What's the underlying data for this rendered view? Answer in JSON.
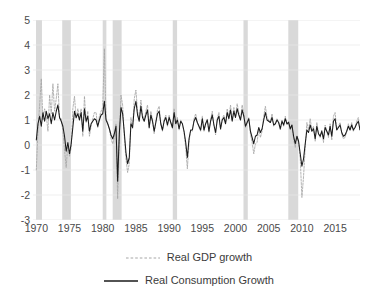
{
  "chart_data": {
    "type": "line",
    "title": "",
    "subtitle": "",
    "xlabel": "",
    "ylabel": "",
    "xlim": [
      1969.5,
      2018.75
    ],
    "ylim": [
      -3,
      5
    ],
    "ytick_values": [
      5,
      4,
      3,
      2,
      1,
      0,
      -1,
      -2,
      -3
    ],
    "ytick_labels": [
      "5",
      "4",
      "3",
      "2",
      "1",
      "0",
      "-1",
      "-2",
      "-3"
    ],
    "xtick_values": [
      1970,
      1975,
      1980,
      1985,
      1990,
      1995,
      2000,
      2005,
      2010,
      2015
    ],
    "xtick_labels": [
      "1970",
      "1975",
      "1980",
      "1985",
      "1990",
      "1995",
      "2000",
      "2005",
      "2010",
      "2015"
    ],
    "grid": "horizontal",
    "legend_position": "bottom-center",
    "colors": {
      "gdp": "#a6a6a6",
      "consumption": "#1a1a1a",
      "recession_band": "#d9d9d9",
      "gridline": "#e8e8e8",
      "axis_text": "#4a4a4a"
    },
    "x_start": 1970,
    "x_step": 0.25,
    "recession_bands": [
      {
        "start": 1969.95,
        "end": 1970.85
      },
      {
        "start": 1973.9,
        "end": 1975.2
      },
      {
        "start": 1980.0,
        "end": 1980.55
      },
      {
        "start": 1981.5,
        "end": 1982.85
      },
      {
        "start": 1990.55,
        "end": 1991.2
      },
      {
        "start": 2001.2,
        "end": 2001.85
      },
      {
        "start": 2007.95,
        "end": 2009.45
      }
    ],
    "series": [
      {
        "name": "Real GDP growth",
        "key": "gdp",
        "style": "dashed",
        "color": "#a6a6a6",
        "values": [
          -1.0,
          0.6,
          1.6,
          2.65,
          1.0,
          1.45,
          1.2,
          0.55,
          2.0,
          1.25,
          2.45,
          1.35,
          1.85,
          2.45,
          1.05,
          1.05,
          0.55,
          -0.2,
          -0.9,
          0.05,
          -0.45,
          -0.1,
          1.45,
          1.95,
          1.05,
          1.45,
          1.1,
          1.45,
          0.35,
          1.95,
          0.9,
          1.35,
          0.35,
          0.75,
          1.05,
          1.3,
          1.3,
          0.7,
          1.15,
          1.35,
          1.5,
          3.85,
          1.05,
          0.9,
          0.65,
          0.25,
          0.05,
          0.3,
          0.85,
          -2.15,
          0.35,
          2.0,
          1.6,
          0.35,
          -0.55,
          -1.1,
          -0.75,
          1.1,
          0.65,
          1.85,
          2.2,
          1.35,
          1.0,
          1.8,
          1.2,
          1.0,
          1.35,
          1.6,
          0.65,
          1.35,
          1.0,
          0.45,
          0.95,
          1.4,
          1.55,
          0.85,
          0.55,
          1.0,
          1.2,
          0.75,
          1.2,
          0.9,
          0.65,
          1.45,
          0.85,
          1.1,
          0.6,
          1.0,
          0.85,
          0.5,
          -0.1,
          -0.95,
          0.1,
          0.6,
          0.55,
          1.05,
          1.25,
          0.9,
          0.7,
          0.55,
          1.15,
          0.55,
          0.85,
          1.05,
          0.5,
          1.0,
          1.35,
          0.8,
          0.4,
          1.05,
          1.3,
          0.6,
          1.05,
          1.2,
          0.85,
          1.45,
          1.1,
          1.6,
          1.0,
          1.5,
          1.15,
          1.65,
          1.3,
          1.0,
          1.6,
          1.25,
          0.7,
          0.9,
          1.1,
          0.45,
          0.1,
          -0.35,
          0.05,
          0.1,
          0.65,
          0.3,
          0.55,
          1.15,
          1.55,
          1.1,
          1.0,
          0.9,
          1.25,
          0.75,
          0.85,
          1.05,
          0.9,
          0.6,
          1.0,
          0.75,
          1.15,
          0.8,
          0.95,
          0.6,
          0.8,
          0.25,
          -0.1,
          0.35,
          0.1,
          -0.55,
          -2.1,
          -1.25,
          -0.1,
          0.9,
          0.6,
          1.05,
          0.6,
          0.75,
          0.15,
          0.9,
          0.45,
          0.3,
          0.6,
          0.1,
          0.8,
          0.55,
          0.3,
          0.85,
          0.2,
          1.15,
          1.3,
          0.6,
          0.75,
          0.9,
          0.45,
          0.25,
          0.3,
          0.55,
          0.85,
          0.6,
          0.9,
          0.55,
          0.7,
          0.95,
          1.1,
          0.6,
          0.85,
          0.75
        ]
      },
      {
        "name": "Real Consumption Growth",
        "key": "consumption",
        "style": "solid",
        "color": "#1a1a1a",
        "values": [
          0.2,
          0.85,
          1.15,
          0.75,
          1.3,
          0.95,
          1.35,
          1.05,
          1.25,
          0.85,
          1.3,
          1.0,
          1.35,
          1.6,
          1.1,
          0.95,
          0.75,
          0.35,
          -0.25,
          0.1,
          -0.35,
          0.05,
          0.7,
          1.35,
          1.1,
          1.25,
          1.0,
          1.3,
          0.55,
          1.45,
          0.95,
          1.15,
          0.55,
          0.85,
          0.95,
          1.05,
          1.0,
          0.75,
          1.0,
          1.2,
          1.25,
          1.75,
          1.0,
          0.85,
          0.65,
          0.4,
          0.25,
          0.45,
          0.75,
          -1.45,
          0.45,
          1.5,
          1.25,
          0.5,
          -0.3,
          -0.75,
          -0.5,
          0.85,
          0.7,
          1.45,
          1.75,
          1.2,
          0.95,
          1.55,
          1.1,
          0.95,
          1.2,
          1.4,
          0.7,
          1.2,
          0.95,
          0.55,
          0.9,
          1.25,
          1.35,
          0.85,
          0.6,
          0.95,
          1.1,
          0.8,
          1.1,
          0.9,
          0.7,
          1.3,
          0.85,
          1.0,
          0.65,
          0.95,
          0.85,
          0.55,
          0.1,
          -0.5,
          0.25,
          0.6,
          0.6,
          0.95,
          1.1,
          0.9,
          0.75,
          0.6,
          1.05,
          0.6,
          0.85,
          1.0,
          0.55,
          0.95,
          1.2,
          0.8,
          0.5,
          1.0,
          1.15,
          0.65,
          1.0,
          1.1,
          0.85,
          1.3,
          1.05,
          1.4,
          0.95,
          1.35,
          1.1,
          1.45,
          1.2,
          1.0,
          1.4,
          1.15,
          0.75,
          0.9,
          1.05,
          0.55,
          0.3,
          0.05,
          0.35,
          0.4,
          0.7,
          0.5,
          0.65,
          1.0,
          1.3,
          1.0,
          0.95,
          0.9,
          1.1,
          0.8,
          0.85,
          1.0,
          0.9,
          0.65,
          0.95,
          0.8,
          1.05,
          0.85,
          0.9,
          0.65,
          0.8,
          0.35,
          0.05,
          0.35,
          0.15,
          -0.35,
          -0.85,
          -0.55,
          0.05,
          0.6,
          0.5,
          0.8,
          0.55,
          0.65,
          0.25,
          0.75,
          0.45,
          0.35,
          0.55,
          0.25,
          0.7,
          0.55,
          0.4,
          0.75,
          0.35,
          0.95,
          1.05,
          0.6,
          0.7,
          0.8,
          0.5,
          0.35,
          0.4,
          0.55,
          0.75,
          0.6,
          0.8,
          0.6,
          0.7,
          0.85,
          0.95,
          0.6,
          0.8,
          0.75
        ]
      }
    ],
    "legend": [
      {
        "label": "Real GDP growth",
        "style": "dashed",
        "color": "#a6a6a6"
      },
      {
        "label": "Real Consumption Growth",
        "style": "solid",
        "color": "#1a1a1a"
      }
    ]
  }
}
